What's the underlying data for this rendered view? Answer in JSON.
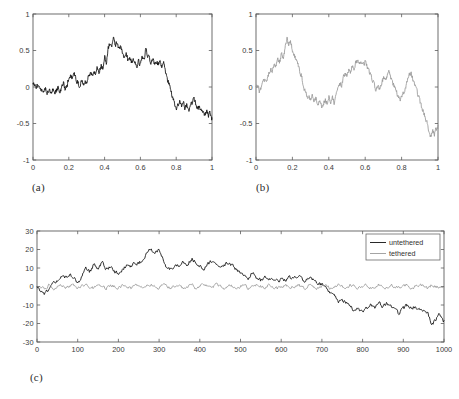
{
  "figure": {
    "caption_a": "(a)",
    "caption_b": "(b)",
    "caption_c": "(c)"
  },
  "colors": {
    "untethered": "#111111",
    "tethered": "#9a9a9a",
    "axis": "#5d5d5d",
    "background": "#ffffff"
  },
  "chart_data": [
    {
      "id": "panel-a",
      "type": "line",
      "title": "",
      "panel_label": "(a)",
      "xlabel": "",
      "ylabel": "",
      "xlim": [
        0,
        1
      ],
      "ylim": [
        -1,
        1
      ],
      "grid": false,
      "legend": null,
      "xticks": [
        0,
        0.2,
        0.4,
        0.6,
        0.8,
        1
      ],
      "xtick_labels": [
        "0",
        "0.2",
        "0.4",
        "0.6",
        "0.8",
        "1"
      ],
      "yticks": [
        -1,
        -0.5,
        0,
        0.5,
        1
      ],
      "ytick_labels": [
        "-1",
        "-0.5",
        "0",
        "0.5",
        "1"
      ],
      "series": [
        {
          "name": "untethered",
          "color": "#111111",
          "x": [
            0,
            0.01,
            0.02,
            0.03,
            0.04,
            0.05,
            0.06,
            0.07,
            0.08,
            0.09,
            0.1,
            0.11,
            0.12,
            0.13,
            0.14,
            0.15,
            0.16,
            0.17,
            0.18,
            0.19,
            0.2,
            0.21,
            0.22,
            0.23,
            0.24,
            0.25,
            0.26,
            0.27,
            0.28,
            0.29,
            0.3,
            0.31,
            0.32,
            0.33,
            0.34,
            0.35,
            0.36,
            0.37,
            0.38,
            0.39,
            0.4,
            0.41,
            0.42,
            0.43,
            0.44,
            0.45,
            0.46,
            0.47,
            0.48,
            0.49,
            0.5,
            0.51,
            0.52,
            0.53,
            0.54,
            0.55,
            0.56,
            0.57,
            0.58,
            0.59,
            0.6,
            0.61,
            0.62,
            0.63,
            0.64,
            0.65,
            0.66,
            0.67,
            0.68,
            0.69,
            0.7,
            0.71,
            0.72,
            0.73,
            0.74,
            0.75,
            0.76,
            0.77,
            0.78,
            0.79,
            0.8,
            0.81,
            0.82,
            0.83,
            0.84,
            0.85,
            0.86,
            0.87,
            0.88,
            0.89,
            0.9,
            0.91,
            0.92,
            0.93,
            0.94,
            0.95,
            0.96,
            0.97,
            0.98,
            0.99,
            1.0
          ],
          "y": [
            0.02,
            0.05,
            -0.01,
            0.03,
            -0.04,
            0.0,
            -0.05,
            -0.02,
            -0.07,
            -0.03,
            -0.08,
            -0.04,
            -0.09,
            -0.05,
            0.0,
            -0.06,
            -0.02,
            0.06,
            -0.03,
            0.01,
            0.12,
            0.16,
            0.1,
            0.17,
            0.11,
            0.05,
            0.02,
            0.08,
            0.03,
            0.1,
            0.05,
            0.14,
            0.2,
            0.15,
            0.22,
            0.18,
            0.26,
            0.21,
            0.3,
            0.25,
            0.42,
            0.35,
            0.52,
            0.6,
            0.55,
            0.68,
            0.58,
            0.62,
            0.5,
            0.56,
            0.45,
            0.4,
            0.46,
            0.38,
            0.42,
            0.33,
            0.4,
            0.34,
            0.3,
            0.36,
            0.3,
            0.42,
            0.35,
            0.52,
            0.44,
            0.38,
            0.33,
            0.39,
            0.32,
            0.36,
            0.3,
            0.34,
            0.28,
            0.32,
            0.22,
            0.12,
            0.04,
            -0.06,
            -0.14,
            -0.22,
            -0.32,
            -0.26,
            -0.2,
            -0.28,
            -0.22,
            -0.3,
            -0.24,
            -0.34,
            -0.28,
            -0.22,
            -0.18,
            -0.24,
            -0.3,
            -0.26,
            -0.34,
            -0.3,
            -0.38,
            -0.33,
            -0.4,
            -0.36,
            -0.44
          ]
        }
      ]
    },
    {
      "id": "panel-b",
      "type": "line",
      "title": "",
      "panel_label": "(b)",
      "xlabel": "",
      "ylabel": "",
      "xlim": [
        0,
        1
      ],
      "ylim": [
        -1,
        1
      ],
      "grid": false,
      "legend": null,
      "xticks": [
        0,
        0.2,
        0.4,
        0.6,
        0.8,
        1
      ],
      "xtick_labels": [
        "0",
        "0.2",
        "0.4",
        "0.6",
        "0.8",
        "1"
      ],
      "yticks": [
        -1,
        -0.5,
        0,
        0.5,
        1
      ],
      "ytick_labels": [
        "-1",
        "-0.5",
        "0",
        "0.5",
        "1"
      ],
      "series": [
        {
          "name": "tethered",
          "color": "#9a9a9a",
          "x": [
            0,
            0.01,
            0.02,
            0.03,
            0.04,
            0.05,
            0.06,
            0.07,
            0.08,
            0.09,
            0.1,
            0.11,
            0.12,
            0.13,
            0.14,
            0.15,
            0.16,
            0.17,
            0.18,
            0.19,
            0.2,
            0.21,
            0.22,
            0.23,
            0.24,
            0.25,
            0.26,
            0.27,
            0.28,
            0.29,
            0.3,
            0.31,
            0.32,
            0.33,
            0.34,
            0.35,
            0.36,
            0.37,
            0.38,
            0.39,
            0.4,
            0.41,
            0.42,
            0.43,
            0.44,
            0.45,
            0.46,
            0.47,
            0.48,
            0.49,
            0.5,
            0.51,
            0.52,
            0.53,
            0.54,
            0.55,
            0.56,
            0.57,
            0.58,
            0.59,
            0.6,
            0.61,
            0.62,
            0.63,
            0.64,
            0.65,
            0.66,
            0.67,
            0.68,
            0.69,
            0.7,
            0.71,
            0.72,
            0.73,
            0.74,
            0.75,
            0.76,
            0.77,
            0.78,
            0.79,
            0.8,
            0.81,
            0.82,
            0.83,
            0.84,
            0.85,
            0.86,
            0.87,
            0.88,
            0.89,
            0.9,
            0.91,
            0.92,
            0.93,
            0.94,
            0.95,
            0.96,
            0.97,
            0.98,
            0.99,
            1.0
          ],
          "y": [
            -0.02,
            0.04,
            -0.08,
            0.02,
            0.08,
            0.14,
            0.1,
            0.18,
            0.26,
            0.22,
            0.32,
            0.28,
            0.38,
            0.34,
            0.46,
            0.41,
            0.52,
            0.67,
            0.58,
            0.62,
            0.5,
            0.44,
            0.36,
            0.3,
            0.22,
            0.14,
            0.04,
            -0.06,
            -0.14,
            -0.1,
            -0.18,
            -0.12,
            -0.2,
            -0.15,
            -0.24,
            -0.18,
            -0.28,
            -0.22,
            -0.17,
            -0.23,
            -0.13,
            -0.19,
            -0.15,
            -0.22,
            -0.1,
            -0.02,
            0.06,
            0.02,
            0.12,
            0.18,
            0.14,
            0.24,
            0.2,
            0.3,
            0.26,
            0.34,
            0.38,
            0.33,
            0.37,
            0.31,
            0.35,
            0.28,
            0.22,
            0.16,
            0.1,
            0.02,
            -0.04,
            0.02,
            -0.02,
            0.06,
            0.12,
            0.08,
            0.16,
            0.2,
            0.14,
            0.08,
            0.0,
            -0.06,
            -0.12,
            -0.18,
            -0.14,
            -0.1,
            -0.04,
            0.06,
            0.14,
            0.2,
            0.12,
            0.04,
            -0.04,
            -0.12,
            -0.2,
            -0.28,
            -0.34,
            -0.42,
            -0.5,
            -0.58,
            -0.68,
            -0.6,
            -0.66,
            -0.58,
            -0.54
          ]
        }
      ]
    },
    {
      "id": "panel-c",
      "type": "line",
      "title": "",
      "panel_label": "(c)",
      "xlabel": "",
      "ylabel": "",
      "xlim": [
        0,
        1000
      ],
      "ylim": [
        -30,
        30
      ],
      "grid": false,
      "legend": {
        "position": "top-right",
        "entries": [
          "untethered",
          "tethered"
        ]
      },
      "xticks": [
        0,
        100,
        200,
        300,
        400,
        500,
        600,
        700,
        800,
        900,
        1000
      ],
      "xtick_labels": [
        "0",
        "100",
        "200",
        "300",
        "400",
        "500",
        "600",
        "700",
        "800",
        "900",
        "1000"
      ],
      "yticks": [
        -30,
        -20,
        -10,
        0,
        10,
        20,
        30
      ],
      "ytick_labels": [
        "-30",
        "-20",
        "-10",
        "0",
        "10",
        "20",
        "30"
      ],
      "series": [
        {
          "name": "untethered",
          "color": "#111111",
          "x": [
            0,
            10,
            20,
            30,
            40,
            50,
            60,
            70,
            80,
            90,
            100,
            110,
            120,
            130,
            140,
            150,
            160,
            170,
            180,
            190,
            200,
            210,
            220,
            230,
            240,
            250,
            260,
            270,
            280,
            290,
            300,
            310,
            320,
            330,
            340,
            350,
            360,
            370,
            380,
            390,
            400,
            410,
            420,
            430,
            440,
            450,
            460,
            470,
            480,
            490,
            500,
            510,
            520,
            530,
            540,
            550,
            560,
            570,
            580,
            590,
            600,
            610,
            620,
            630,
            640,
            650,
            660,
            670,
            680,
            690,
            700,
            710,
            720,
            730,
            740,
            750,
            760,
            770,
            780,
            790,
            800,
            810,
            820,
            830,
            840,
            850,
            860,
            870,
            880,
            890,
            900,
            910,
            920,
            930,
            940,
            950,
            960,
            970,
            980,
            990,
            1000
          ],
          "y": [
            -1,
            -2,
            -4,
            -1,
            2,
            4,
            6,
            5,
            7,
            5,
            2,
            5,
            10,
            8,
            12,
            10,
            13,
            9,
            11,
            8,
            7,
            9,
            11,
            10,
            13,
            12,
            15,
            18,
            20,
            19,
            20,
            14,
            10,
            9,
            12,
            11,
            13,
            12,
            15,
            13,
            11,
            10,
            12,
            14,
            12,
            10,
            12,
            13,
            11,
            9,
            7,
            6,
            4,
            8,
            5,
            3,
            6,
            4,
            5,
            3,
            4,
            3,
            5,
            4,
            6,
            4,
            3,
            5,
            4,
            2,
            1,
            -1,
            -3,
            -5,
            -8,
            -7,
            -9,
            -11,
            -13,
            -12,
            -14,
            -12,
            -10,
            -12,
            -9,
            -11,
            -9,
            -11,
            -13,
            -15,
            -12,
            -10,
            -12,
            -11,
            -13,
            -12,
            -14,
            -21,
            -18,
            -15,
            -19
          ]
        },
        {
          "name": "tethered",
          "color": "#9a9a9a",
          "x": [
            0,
            10,
            20,
            30,
            40,
            50,
            60,
            70,
            80,
            90,
            100,
            110,
            120,
            130,
            140,
            150,
            160,
            170,
            180,
            190,
            200,
            210,
            220,
            230,
            240,
            250,
            260,
            270,
            280,
            290,
            300,
            310,
            320,
            330,
            340,
            350,
            360,
            370,
            380,
            390,
            400,
            410,
            420,
            430,
            440,
            450,
            460,
            470,
            480,
            490,
            500,
            510,
            520,
            530,
            540,
            550,
            560,
            570,
            580,
            590,
            600,
            610,
            620,
            630,
            640,
            650,
            660,
            670,
            680,
            690,
            700,
            710,
            720,
            730,
            740,
            750,
            760,
            770,
            780,
            790,
            800,
            810,
            820,
            830,
            840,
            850,
            860,
            870,
            880,
            890,
            900,
            910,
            920,
            930,
            940,
            950,
            960,
            970,
            980,
            990,
            1000
          ],
          "y": [
            -1,
            0,
            -2,
            1,
            -1,
            0,
            1,
            -1,
            0,
            1,
            -1,
            0,
            1,
            0,
            -1,
            1,
            0,
            -1,
            1,
            0,
            -1,
            1,
            0,
            -1,
            0,
            1,
            -1,
            0,
            1,
            0,
            -1,
            1,
            0,
            -1,
            1,
            0,
            -1,
            0,
            1,
            -1,
            0,
            1,
            0,
            -1,
            1,
            0,
            -1,
            1,
            0,
            -1,
            0,
            1,
            -1,
            0,
            1,
            0,
            -1,
            1,
            0,
            -1,
            0,
            1,
            -1,
            0,
            1,
            0,
            -1,
            1,
            0,
            -1,
            0,
            1,
            -1,
            0,
            1,
            0,
            -1,
            1,
            0,
            -1,
            0,
            1,
            -1,
            0,
            1,
            0,
            -1,
            1,
            0,
            -1,
            0,
            1,
            -1,
            0,
            1,
            0,
            -1,
            1,
            0,
            -1,
            -1
          ]
        }
      ]
    }
  ]
}
